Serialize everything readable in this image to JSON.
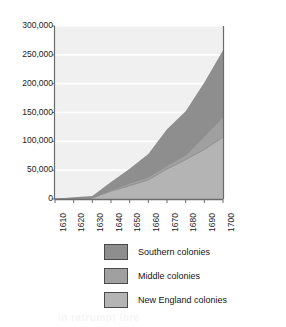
{
  "chart_data": {
    "type": "area",
    "stacked": true,
    "title": "",
    "subtitle": "",
    "xlabel": "",
    "ylabel": "",
    "x": [
      1610,
      1620,
      1630,
      1640,
      1650,
      1660,
      1670,
      1680,
      1690,
      1700
    ],
    "categories": [
      "1610",
      "1620",
      "1630",
      "1640",
      "1650",
      "1660",
      "1670",
      "1680",
      "1690",
      "1700"
    ],
    "xlim": [
      1610,
      1700
    ],
    "ylim": [
      0,
      300000
    ],
    "yticks": [
      0,
      50000,
      100000,
      150000,
      200000,
      250000,
      300000
    ],
    "ytick_labels": [
      "0",
      "50,000",
      "100,000",
      "150,000",
      "200,000",
      "250,000",
      "300,000"
    ],
    "xtick_labels": [
      "1610",
      "1620",
      "1630",
      "1640",
      "1650",
      "1660",
      "1670",
      "1680",
      "1690",
      "1700"
    ],
    "xtick_rotation": -90,
    "grid": "horizontal",
    "legend_position": "bottom",
    "series": [
      {
        "name": "New England colonies",
        "color": "#b4b4b4",
        "stack_order": 1,
        "values": [
          0,
          500,
          1800,
          13700,
          23000,
          33000,
          52000,
          68000,
          86000,
          107000
        ]
      },
      {
        "name": "Middle colonies",
        "color": "#a0a0a0",
        "stack_order": 2,
        "values": [
          0,
          300,
          500,
          1900,
          4500,
          5000,
          6000,
          8000,
          23000,
          35000
        ]
      },
      {
        "name": "Southern colonies",
        "color": "#8e8e8e",
        "stack_order": 3,
        "values": [
          350,
          2300,
          3000,
          14000,
          25000,
          40000,
          63000,
          76000,
          93000,
          116000
        ]
      }
    ],
    "cumulative": {
      "new_england": [
        0,
        500,
        1800,
        13700,
        23000,
        33000,
        52000,
        68000,
        86000,
        107000
      ],
      "middle": [
        0,
        800,
        2300,
        15600,
        27500,
        38000,
        58000,
        76000,
        109000,
        142000
      ],
      "total": [
        350,
        3100,
        5300,
        29600,
        52500,
        78000,
        121000,
        152000,
        202000,
        258000
      ]
    }
  },
  "legend": {
    "items": [
      {
        "label": "Southern colonies",
        "color": "#8e8e8e"
      },
      {
        "label": "Middle colonies",
        "color": "#a0a0a0"
      },
      {
        "label": "New England colonies",
        "color": "#b4b4b4"
      }
    ]
  },
  "colors": {
    "plot_background": "#f0f0f0",
    "gridline": "#ffffff",
    "axis_line": "#6b6b6b",
    "text": "#1b1b1b",
    "southern": "#8e8e8e",
    "middle": "#a0a0a0",
    "new_england": "#b4b4b4"
  },
  "artifacts": {
    "ghost_text": [
      "IT SI III IIT",
      "IONS Controversi",
      "and Changes",
      "ruoritis sitw bas",
      "enitonos lenitnos",
      "in ratrumpt ihre"
    ]
  }
}
